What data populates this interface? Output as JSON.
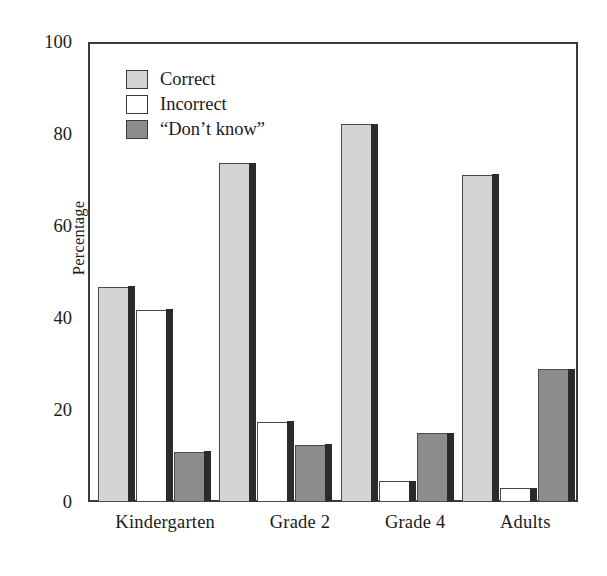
{
  "chart_data": {
    "type": "bar",
    "title": "",
    "subtitle": "",
    "xlabel": "",
    "ylabel": "Percentage",
    "ylim": [
      0,
      100
    ],
    "yticks": [
      0,
      20,
      40,
      60,
      80,
      100
    ],
    "ytick_labels": [
      "0",
      "20",
      "40",
      "60",
      "80",
      "100"
    ],
    "grid": false,
    "legend_position": "upper-left-inside",
    "categories": [
      "Kindergarten",
      "Grade 2",
      "Grade 4",
      "Adults"
    ],
    "series": [
      {
        "name": "Correct",
        "color": "#d4d4d4",
        "values": [
          47,
          74,
          82.5,
          71.5
        ]
      },
      {
        "name": "Incorrect",
        "color": "#ffffff",
        "values": [
          42,
          17.5,
          4.5,
          3
        ]
      },
      {
        "name": "“Don’t know”",
        "color": "#8c8c8c",
        "values": [
          11,
          12.5,
          15,
          29
        ]
      }
    ]
  },
  "axis": {
    "y_title": "Percentage",
    "y_ticks": [
      {
        "label": "100",
        "value": 100
      },
      {
        "label": "80",
        "value": 80
      },
      {
        "label": "60",
        "value": 60
      },
      {
        "label": "40",
        "value": 40
      },
      {
        "label": "20",
        "value": 20
      },
      {
        "label": "0",
        "value": 0
      }
    ],
    "x_labels": [
      "Kindergarten",
      "Grade 2",
      "Grade 4",
      "Adults"
    ]
  },
  "legend": {
    "items": [
      {
        "label": "Correct",
        "swatch": "light-gray-swatch"
      },
      {
        "label": "Incorrect",
        "swatch": "white-swatch"
      },
      {
        "label": "“Don’t know”",
        "swatch": "dark-gray-swatch"
      }
    ]
  },
  "colors": {
    "correct": "#d4d4d4",
    "incorrect": "#ffffff",
    "dontknow": "#8c8c8c",
    "axis": "#3a3a3a",
    "bar_shadow": "#2b2b2b",
    "background": "#ffffff"
  }
}
